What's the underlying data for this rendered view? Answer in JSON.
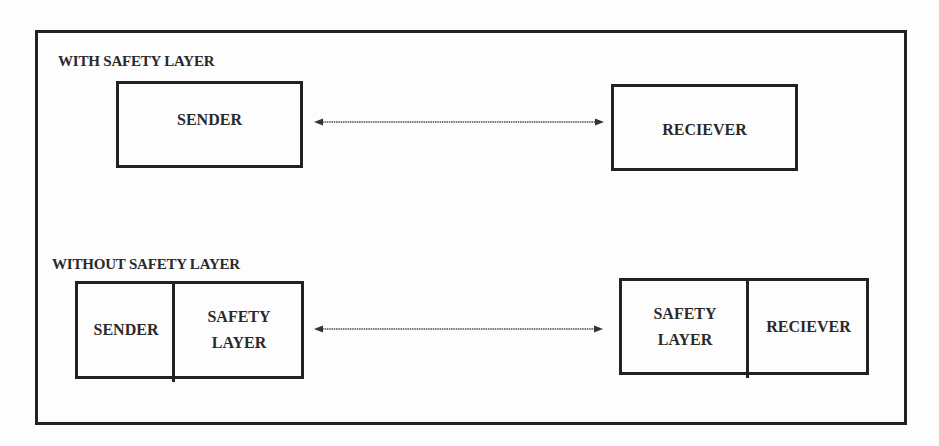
{
  "diagram": {
    "with_section": {
      "title": "WITH SAFETY LAYER",
      "sender": "SENDER",
      "receiver": "RECIEVER",
      "connector": "bidirectional-arrow"
    },
    "without_section": {
      "title": "WITHOUT SAFETY LAYER",
      "left_box": {
        "part1": "SENDER",
        "part2_line1": "SAFETY",
        "part2_line2": "LAYER"
      },
      "right_box": {
        "part1_line1": "SAFETY",
        "part1_line2": "LAYER",
        "part2": "RECIEVER"
      },
      "connector": "bidirectional-arrow"
    },
    "colors": {
      "line": "#222222",
      "arrow": "#777777",
      "background": "#fdfdfd"
    }
  }
}
